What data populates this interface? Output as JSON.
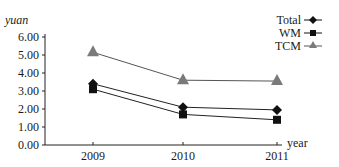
{
  "chart_data": {
    "type": "line",
    "title": "",
    "xlabel": "year",
    "ylabel": "yuan",
    "categories": [
      "2009",
      "2010",
      "2011"
    ],
    "x": [
      2009,
      2010,
      2011
    ],
    "ylim": [
      0,
      6
    ],
    "yticks": [
      "0.00",
      "1.00",
      "2.00",
      "3.00",
      "4.00",
      "5.00",
      "6.00"
    ],
    "grid": false,
    "legend_position": "top-right",
    "series": [
      {
        "name": "Total",
        "marker": "diamond",
        "color": "#111111",
        "values": [
          3.4,
          2.1,
          1.95
        ]
      },
      {
        "name": "WM",
        "marker": "square",
        "color": "#111111",
        "values": [
          3.1,
          1.7,
          1.4
        ]
      },
      {
        "name": "TCM",
        "marker": "triangle",
        "color": "#7a7a7a",
        "values": [
          5.15,
          3.6,
          3.55
        ]
      }
    ]
  },
  "axes": {
    "y_title": "yuan",
    "x_title": "year"
  },
  "legend": {
    "items": [
      {
        "label": "Total"
      },
      {
        "label": "WM"
      },
      {
        "label": "TCM"
      }
    ]
  }
}
